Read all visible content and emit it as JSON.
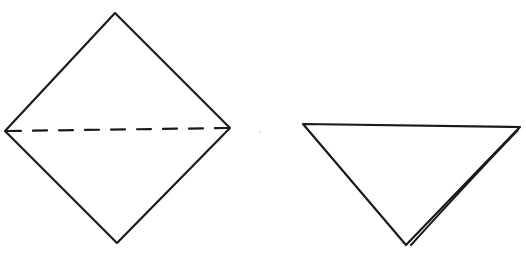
{
  "diagram": {
    "type": "origami-fold-steps",
    "steps": [
      {
        "name": "square-diamond",
        "description": "Square paper rotated as diamond with dashed horizontal valley-fold line",
        "vertices": {
          "top": [
            115,
            13
          ],
          "left": [
            5,
            131
          ],
          "right": [
            230,
            128
          ],
          "bottom": [
            117,
            243
          ]
        },
        "fold_line": {
          "style": "dashed",
          "from": [
            5,
            131
          ],
          "to": [
            230,
            128
          ]
        }
      },
      {
        "name": "folded-triangle",
        "description": "Result after folding in half: inverted triangle with doubled right edge showing layers",
        "vertices": {
          "top_left": [
            303,
            124
          ],
          "top_right": [
            520,
            127
          ],
          "bottom": [
            406,
            245
          ]
        }
      }
    ],
    "stroke_color": "#1a1a1a",
    "background": "#ffffff"
  }
}
